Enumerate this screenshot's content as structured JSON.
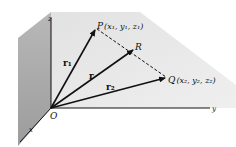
{
  "diagram": {
    "type": "3d-vector-position-diagram",
    "axes": {
      "x_label": "x",
      "y_label": "y",
      "z_label": "z",
      "origin_label": "O"
    },
    "points": {
      "P": {
        "label": "P",
        "coords": "(x₁, y₁, z₁)"
      },
      "Q": {
        "label": "Q",
        "coords": "(x₂, y₂, z₂)"
      },
      "R": {
        "label": "R"
      }
    },
    "vectors": {
      "r1": "r₁",
      "r": "r",
      "r2": "r₂"
    },
    "segments": [
      {
        "from": "P",
        "to": "Q",
        "style": "dashed"
      }
    ],
    "colors": {
      "yz_plane": "#e6e6e6",
      "xz_plane": "#a9a9a9",
      "ink": "#111111"
    }
  }
}
